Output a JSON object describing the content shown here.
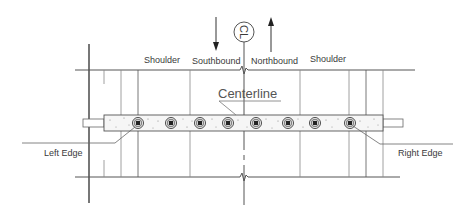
{
  "diagram": {
    "labels": {
      "shoulder_left": "Shoulder",
      "southbound": "Southbound",
      "northbound": "Northbound",
      "shoulder_right": "Shoulder",
      "centerline": "Centerline",
      "left_edge": "Left Edge",
      "right_edge": "Right Edge",
      "cl_symbol": "CL"
    },
    "directions": {
      "southbound_arrow": "down",
      "northbound_arrow": "up"
    },
    "dowel_count": 8,
    "colors": {
      "line": "#555555",
      "slab_fill": "#f4f4f4",
      "dowel_core": "#222222"
    }
  }
}
